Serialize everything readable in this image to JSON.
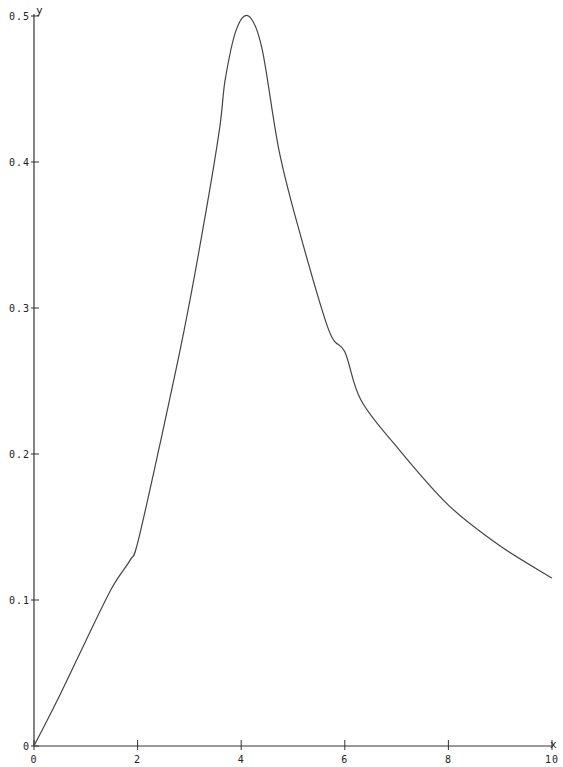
{
  "chart_data": {
    "type": "line",
    "title": "",
    "xlabel": "x",
    "ylabel": "y",
    "xlim": [
      0,
      10
    ],
    "ylim": [
      0,
      0.5
    ],
    "grid": false,
    "legend": null,
    "x_ticks": [
      "0",
      "2",
      "4",
      "6",
      "8",
      "10"
    ],
    "y_ticks": [
      "0",
      "0.1",
      "0.2",
      "0.3",
      "0.4",
      "0.5"
    ],
    "series": [
      {
        "name": "y(x)",
        "x": [
          0,
          0.5,
          1.0,
          1.5,
          1.85,
          2.0,
          2.42,
          2.9,
          3.29,
          3.58,
          3.69,
          3.9,
          4.14,
          4.4,
          4.73,
          5.12,
          5.69,
          6.0,
          6.31,
          7.0,
          8.0,
          9.0,
          10.0
        ],
        "values": [
          0,
          0.035,
          0.072,
          0.108,
          0.127,
          0.139,
          0.205,
          0.285,
          0.36,
          0.422,
          0.456,
          0.49,
          0.5,
          0.478,
          0.408,
          0.353,
          0.285,
          0.27,
          0.237,
          0.205,
          0.165,
          0.137,
          0.115
        ]
      }
    ]
  }
}
